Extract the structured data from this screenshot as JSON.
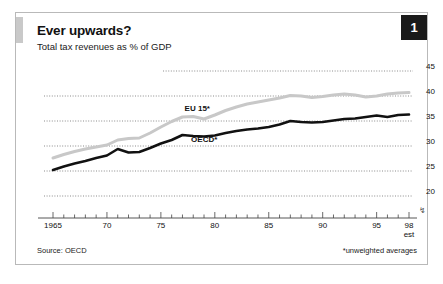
{
  "figure": {
    "number_badge": "1",
    "title": "Ever upwards?",
    "subtitle": "Total tax revenues as % of GDP",
    "source": "Source: OECD",
    "note": "*unweighted averages",
    "axis_break_symbol": "↯"
  },
  "chart_data": {
    "type": "line",
    "title": "Ever upwards?",
    "subtitle": "Total tax revenues as % of GDP",
    "xlabel": "",
    "ylabel": "Total tax revenues as % of GDP",
    "xlim": [
      1965,
      1998
    ],
    "ylim": [
      20,
      45
    ],
    "yticks": [
      20,
      25,
      30,
      35,
      40,
      45
    ],
    "ytick_labels": [
      "20",
      "25",
      "30",
      "35",
      "40",
      "45"
    ],
    "xticks": [
      1965,
      1970,
      1975,
      1980,
      1985,
      1990,
      1995,
      1998
    ],
    "xtick_labels": [
      "1965",
      "70",
      "75",
      "80",
      "85",
      "90",
      "95",
      "98"
    ],
    "xtick_sublabel_last": "est",
    "minor_xticks_interval": 1,
    "grid": "horizontal-dotted",
    "legend": "inline-labels",
    "axis_break_below": 20,
    "x": [
      1965,
      1966,
      1967,
      1968,
      1969,
      1970,
      1971,
      1972,
      1973,
      1974,
      1975,
      1976,
      1977,
      1978,
      1979,
      1980,
      1981,
      1982,
      1983,
      1984,
      1985,
      1986,
      1987,
      1988,
      1989,
      1990,
      1991,
      1992,
      1993,
      1994,
      1995,
      1996,
      1997,
      1998
    ],
    "series": [
      {
        "name": "EU 15*",
        "color": "#c8c8c8",
        "label_position": {
          "x": 1977.2,
          "y": 37.4
        },
        "values": [
          27.6,
          28.3,
          28.9,
          29.4,
          29.8,
          30.2,
          31.2,
          31.5,
          31.6,
          32.6,
          33.8,
          34.9,
          35.8,
          35.9,
          35.4,
          36.2,
          37.1,
          37.8,
          38.4,
          38.8,
          39.2,
          39.6,
          40.1,
          40.0,
          39.7,
          39.9,
          40.2,
          40.4,
          40.2,
          39.8,
          40.0,
          40.4,
          40.6,
          40.7
        ]
      },
      {
        "name": "OECD*",
        "color": "#111111",
        "label_position": {
          "x": 1977.8,
          "y": 31.2
        },
        "values": [
          25.2,
          25.9,
          26.5,
          27.0,
          27.6,
          28.1,
          29.4,
          28.7,
          28.8,
          29.6,
          30.5,
          31.2,
          32.2,
          32.0,
          31.9,
          32.1,
          32.6,
          33.0,
          33.3,
          33.5,
          33.8,
          34.3,
          35.0,
          34.8,
          34.7,
          34.8,
          35.1,
          35.4,
          35.5,
          35.8,
          36.1,
          35.8,
          36.2,
          36.3
        ]
      }
    ]
  }
}
